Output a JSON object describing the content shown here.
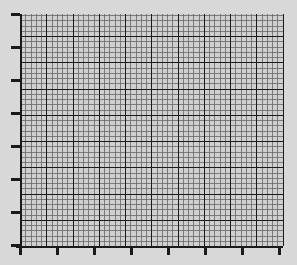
{
  "figure": {
    "name": "graph-paper-plot",
    "background_color": "#d8d8d8",
    "width": 297,
    "height": 265,
    "title": "",
    "has_title": false,
    "has_legend": false,
    "has_tick_labels": false
  },
  "chart_data": {
    "type": "line",
    "title": "",
    "subtitle": "",
    "xlabel": "",
    "ylabel": "",
    "series": [
      {
        "name": "empty-series",
        "x": [],
        "y": [],
        "values": []
      }
    ],
    "categories": [],
    "x": [],
    "values": [],
    "annotations": [],
    "legend": {
      "visible": false,
      "position": "none",
      "entries": []
    },
    "grid": {
      "visible": true,
      "style": "graph-paper",
      "minor_visible": true,
      "major_visible": true,
      "minor_color": "#666666",
      "major_color": "#1a1a1a",
      "minor_linewidth": 0.8,
      "major_linewidth": 1.6,
      "minor_step_px": 5.25,
      "major_every_n_minor": 5,
      "plot_fill": "#cfcfcf"
    },
    "axes": {
      "plot_left_px": 20,
      "plot_top_px": 14,
      "plot_right_px": 283,
      "plot_bottom_px": 246,
      "xlim": [
        0,
        50
      ],
      "ylim": [
        0,
        44
      ],
      "x_major_tick_count": 8,
      "y_major_tick_count": 7,
      "x_major_tick_positions_px": [
        20,
        57,
        94,
        131,
        168,
        205,
        242,
        279
      ],
      "y_major_tick_positions_px": [
        14,
        47,
        80,
        113,
        146,
        179,
        212,
        245
      ],
      "x_tick_labels": [],
      "y_tick_labels": [],
      "tick_direction": "out",
      "x_tick_length_px": 9,
      "y_tick_length_px": 9,
      "spine_color": "#1a1a1a",
      "spine_left_visible": true,
      "spine_bottom_visible": true,
      "spine_top_visible": false,
      "spine_right_visible": false
    }
  }
}
